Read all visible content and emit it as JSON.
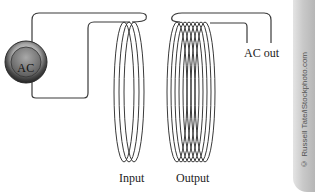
{
  "diagram": {
    "source": {
      "label": "AC",
      "icon": "ac-source-icon"
    },
    "input_coil": {
      "label": "Input",
      "turns": 3
    },
    "output_coil": {
      "label": "Output",
      "turns": 8
    },
    "output_terminal": {
      "label": "AC out"
    },
    "credit": "© Russell Tate/iStockphoto.com"
  },
  "colors": {
    "wire": "#3a3a3a",
    "background": "#ffffff",
    "edge": "#c4c4c4"
  }
}
